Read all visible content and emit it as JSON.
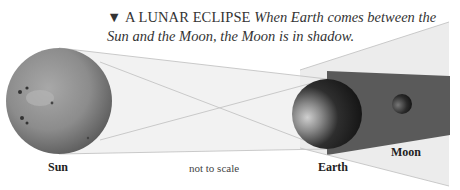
{
  "caption": {
    "marker": "▼",
    "heading": "A LUNAR ECLIPSE",
    "body": "When Earth comes between the Sun and the Moon, the Moon is in shadow."
  },
  "labels": {
    "sun": "Sun",
    "earth": "Earth",
    "moon": "Moon",
    "scale_note": "not to scale"
  },
  "colors": {
    "background": "#ffffff",
    "penumbra": "#ececec",
    "umbra": "#5a5a5a",
    "ray_lines": "#c8c8c8",
    "sun": "#8a8a8a",
    "earth": "#3a3a3a",
    "moon": "#2a2a2a"
  }
}
